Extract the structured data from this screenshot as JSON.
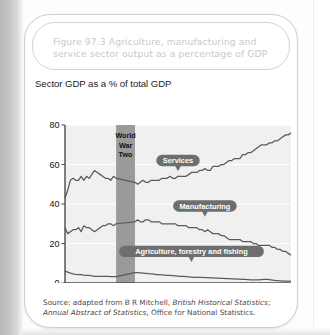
{
  "figure": {
    "title": "Figure 97.3  Agriculture, manufacturing and service sector output as a percentage of GDP",
    "subtitle": "Sector GDP as a % of total GDP",
    "source_prefix": "Source: adapted from B R Mitchell, ",
    "source_italic_1": "British Historical Statistics",
    "source_mid": "; ",
    "source_italic_2": "Annual Abstract of Statistics",
    "source_suffix": ", Office for National Statistics."
  },
  "colors": {
    "title_text": "#c9c9c9",
    "plot_bg": "#f0f0f0",
    "gridline": "#ffffff",
    "axis": "#4a4a4a",
    "series_line": "#5a5a5a",
    "war_band": "#9a9a9a",
    "callout_bg": "#6e6e6e",
    "callout_text": "#ffffff",
    "page_gutter": "#c0c0c0"
  },
  "annotations": {
    "war_band_label_lines": [
      "World",
      "War",
      "Two"
    ],
    "war_band_start": 1939,
    "war_band_end": 1946
  },
  "chart_data": {
    "type": "line",
    "title": "Sector GDP as a % of total GDP",
    "xlabel": "",
    "ylabel": "",
    "xlim": [
      1920,
      2004
    ],
    "ylim": [
      0,
      80
    ],
    "yticks": [
      0,
      20,
      40,
      60,
      80
    ],
    "grid": true,
    "legend_position": "inline-callouts",
    "xtick_labels": [
      "1920",
      "25",
      "30",
      "35",
      "40",
      "45",
      "50",
      "55",
      "60",
      "65",
      "70",
      "75",
      "80",
      "85",
      "90",
      "95",
      "00",
      "04"
    ],
    "xtick_values": [
      1920,
      1925,
      1930,
      1935,
      1940,
      1945,
      1950,
      1955,
      1960,
      1965,
      1970,
      1975,
      1980,
      1985,
      1990,
      1995,
      2000,
      2004
    ],
    "series": [
      {
        "name": "Services",
        "label_x": 1962,
        "label_y": 62,
        "x": [
          1920,
          1921,
          1922,
          1923,
          1924,
          1925,
          1926,
          1927,
          1928,
          1929,
          1930,
          1931,
          1932,
          1933,
          1934,
          1935,
          1936,
          1937,
          1938,
          1939,
          1946,
          1947,
          1948,
          1949,
          1950,
          1951,
          1952,
          1953,
          1954,
          1955,
          1956,
          1957,
          1958,
          1959,
          1960,
          1961,
          1962,
          1963,
          1964,
          1965,
          1966,
          1967,
          1968,
          1969,
          1970,
          1971,
          1972,
          1973,
          1974,
          1975,
          1976,
          1977,
          1978,
          1979,
          1980,
          1981,
          1982,
          1983,
          1984,
          1985,
          1986,
          1987,
          1988,
          1989,
          1990,
          1991,
          1992,
          1993,
          1994,
          1995,
          1996,
          1997,
          1998,
          1999,
          2000,
          2001,
          2002,
          2003,
          2004
        ],
        "y": [
          43,
          47,
          52,
          53,
          52,
          52,
          54,
          52,
          54,
          53,
          55,
          57,
          56,
          55,
          54,
          53,
          53,
          52,
          54,
          53,
          51,
          50,
          51,
          52,
          51,
          51,
          52,
          52,
          52,
          52,
          53,
          53,
          53,
          54,
          53,
          53,
          54,
          54,
          54,
          54,
          55,
          56,
          56,
          56,
          57,
          57,
          58,
          57,
          57,
          59,
          59,
          59,
          60,
          60,
          61,
          62,
          62,
          63,
          63,
          63,
          65,
          65,
          66,
          66,
          67,
          68,
          69,
          70,
          70,
          70,
          71,
          71,
          72,
          72,
          73,
          74,
          75,
          75,
          76
        ]
      },
      {
        "name": "Manufacturing",
        "label_x": 1972,
        "label_y": 39,
        "x": [
          1920,
          1921,
          1922,
          1923,
          1924,
          1925,
          1926,
          1927,
          1928,
          1929,
          1930,
          1931,
          1932,
          1933,
          1934,
          1935,
          1936,
          1937,
          1938,
          1939,
          1946,
          1947,
          1948,
          1949,
          1950,
          1951,
          1952,
          1953,
          1954,
          1955,
          1956,
          1957,
          1958,
          1959,
          1960,
          1961,
          1962,
          1963,
          1964,
          1965,
          1966,
          1967,
          1968,
          1969,
          1970,
          1971,
          1972,
          1973,
          1974,
          1975,
          1976,
          1977,
          1978,
          1979,
          1980,
          1981,
          1982,
          1983,
          1984,
          1985,
          1986,
          1987,
          1988,
          1989,
          1990,
          1991,
          1992,
          1993,
          1994,
          1995,
          1996,
          1997,
          1998,
          1999,
          2000,
          2001,
          2002,
          2003,
          2004
        ],
        "y": [
          28,
          25,
          26,
          27,
          27,
          28,
          26,
          29,
          28,
          28,
          27,
          26,
          27,
          28,
          29,
          29,
          30,
          30,
          29,
          30,
          31,
          32,
          31,
          31,
          32,
          32,
          31,
          31,
          31,
          31,
          30,
          30,
          30,
          30,
          30,
          30,
          29,
          29,
          29,
          29,
          28,
          28,
          28,
          28,
          27,
          27,
          26,
          27,
          26,
          25,
          25,
          25,
          24,
          24,
          23,
          22,
          22,
          22,
          22,
          22,
          21,
          21,
          21,
          21,
          20,
          20,
          19,
          19,
          19,
          19,
          19,
          18,
          18,
          17,
          17,
          16,
          16,
          15,
          14
        ]
      },
      {
        "name": "Agriculture, forestry and fishing",
        "label_x": 1967,
        "label_y": 16,
        "x": [
          1920,
          1921,
          1922,
          1923,
          1924,
          1925,
          1926,
          1927,
          1928,
          1929,
          1930,
          1931,
          1932,
          1933,
          1934,
          1935,
          1936,
          1937,
          1938,
          1939,
          1946,
          1947,
          1948,
          1949,
          1950,
          1951,
          1952,
          1953,
          1954,
          1955,
          1956,
          1957,
          1958,
          1959,
          1960,
          1961,
          1962,
          1963,
          1964,
          1965,
          1966,
          1967,
          1968,
          1969,
          1970,
          1971,
          1972,
          1973,
          1974,
          1975,
          1976,
          1977,
          1978,
          1979,
          1980,
          1981,
          1982,
          1983,
          1984,
          1985,
          1986,
          1987,
          1988,
          1989,
          1990,
          1991,
          1992,
          1993,
          1994,
          1995,
          1996,
          1997,
          1998,
          1999,
          2000,
          2001,
          2002,
          2003,
          2004
        ],
        "y": [
          6,
          5.5,
          5,
          4.6,
          4.4,
          4.3,
          4.2,
          4.0,
          3.9,
          3.8,
          3.6,
          3.4,
          3.4,
          3.4,
          3.3,
          3.3,
          3.3,
          3.2,
          3.2,
          3.2,
          5.2,
          5.2,
          5.1,
          5.0,
          4.9,
          4.7,
          4.6,
          4.5,
          4.3,
          4.2,
          4.1,
          4.0,
          3.9,
          3.8,
          3.7,
          3.6,
          3.5,
          3.4,
          3.3,
          3.2,
          3.1,
          3.0,
          2.9,
          2.9,
          2.8,
          2.8,
          2.7,
          2.7,
          2.6,
          2.6,
          2.5,
          2.5,
          2.4,
          2.3,
          2.2,
          2.2,
          2.1,
          2.1,
          2.0,
          1.9,
          1.8,
          1.8,
          1.7,
          1.6,
          1.6,
          1.6,
          1.6,
          1.7,
          1.8,
          1.8,
          1.7,
          1.5,
          1.3,
          1.2,
          1.1,
          0.9,
          1.0,
          1.0,
          1.0
        ]
      }
    ]
  }
}
